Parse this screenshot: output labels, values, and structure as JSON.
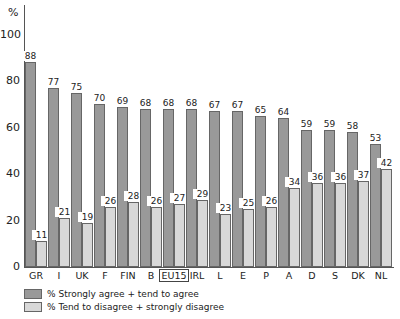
{
  "chart_data": {
    "type": "bar",
    "title": "",
    "xlabel": "",
    "ylabel": "%",
    "ylim": [
      0,
      100
    ],
    "yticks": [
      0,
      20,
      40,
      60,
      80,
      100
    ],
    "grid": false,
    "legend_position": "bottom-left",
    "categories": [
      "GR",
      "I",
      "UK",
      "F",
      "FIN",
      "B",
      "EU15",
      "IRL",
      "L",
      "E",
      "P",
      "A",
      "D",
      "S",
      "DK",
      "NL"
    ],
    "highlighted_category": "EU15",
    "series": [
      {
        "name": "% Strongly agree + tend to agree",
        "color": "#999999",
        "values": [
          88,
          77,
          75,
          70,
          69,
          68,
          68,
          68,
          67,
          67,
          65,
          64,
          59,
          59,
          58,
          53
        ]
      },
      {
        "name": "% Tend to disagree + strongly disagree",
        "color": "#d8d8d8",
        "values": [
          11,
          21,
          19,
          26,
          28,
          26,
          27,
          29,
          23,
          25,
          26,
          34,
          36,
          36,
          37,
          42
        ]
      }
    ]
  },
  "axis": {
    "unit_label": "%"
  },
  "legend": {
    "agree": "% Strongly agree + tend to agree",
    "disagree": "% Tend to disagree + strongly disagree"
  }
}
